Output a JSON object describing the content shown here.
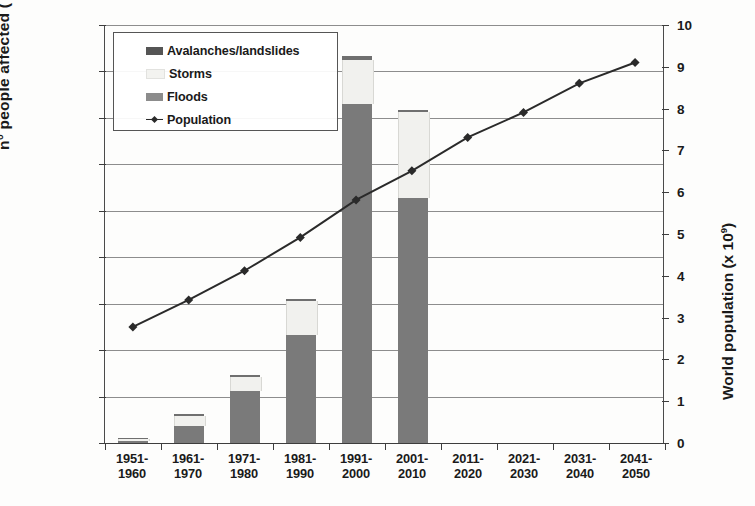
{
  "chart_data": {
    "type": "bar",
    "title": "",
    "subtitle": "",
    "xlabel": "",
    "ylabel": "n° people affected ( x 10⁶)",
    "ylabel_secondary": "World population (x 10⁹)",
    "ylim": [
      0,
      180
    ],
    "ylim_secondary": [
      0,
      10
    ],
    "yticks": [
      0,
      20,
      40,
      60,
      80,
      100,
      120,
      140,
      160,
      180
    ],
    "yticks_secondary": [
      0,
      1,
      2,
      3,
      4,
      5,
      6,
      7,
      8,
      9,
      10
    ],
    "grid": true,
    "legend_position": "upper-left",
    "stacked": true,
    "categories": [
      "1951-\n1960",
      "1961-\n1970",
      "1971-\n1980",
      "1981-\n1990",
      "1991-\n2000",
      "2001-\n2010",
      "2011-\n2020",
      "2021-\n2030",
      "2031-\n2040",
      "2041-\n2050"
    ],
    "category_labels": [
      {
        "top": "1951-",
        "bottom": "1960"
      },
      {
        "top": "1961-",
        "bottom": "1970"
      },
      {
        "top": "1971-",
        "bottom": "1980"
      },
      {
        "top": "1981-",
        "bottom": "1990"
      },
      {
        "top": "1991-",
        "bottom": "2000"
      },
      {
        "top": "2001-",
        "bottom": "2010"
      },
      {
        "top": "2011-",
        "bottom": "2020"
      },
      {
        "top": "2021-",
        "bottom": "2030"
      },
      {
        "top": "2031-",
        "bottom": "2040"
      },
      {
        "top": "2041-",
        "bottom": "2050"
      }
    ],
    "series": [
      {
        "name": "Floods",
        "axis": "left",
        "color": "#7a7a7a",
        "values": [
          1.0,
          7.5,
          22.5,
          46.5,
          146.0,
          105.5,
          null,
          null,
          null,
          null
        ]
      },
      {
        "name": "Storms",
        "axis": "left",
        "color": "#f1f1ee",
        "values": [
          0.8,
          4.0,
          6.0,
          14.5,
          19.0,
          37.0,
          null,
          null,
          null,
          null
        ]
      },
      {
        "name": "Avalanches/landslides",
        "axis": "left",
        "color": "#6f6f6f",
        "values": [
          0.4,
          0.8,
          1.0,
          1.0,
          1.5,
          1.0,
          null,
          null,
          null,
          null
        ]
      },
      {
        "name": "Population",
        "axis": "right",
        "type": "line",
        "color": "#2a2a2a",
        "values": [
          2.75,
          3.4,
          4.1,
          4.9,
          5.8,
          6.5,
          7.3,
          7.9,
          8.6,
          9.1
        ]
      }
    ],
    "stack_totals": [
      2.2,
      12.3,
      29.5,
      62.0,
      166.5,
      143.5,
      null,
      null,
      null,
      null
    ]
  },
  "legend": {
    "items": [
      {
        "label": "Avalanches/landslides",
        "swatch": "avalanches-swatch"
      },
      {
        "label": "Storms",
        "swatch": "storms-swatch"
      },
      {
        "label": "Floods",
        "swatch": "floods-swatch"
      },
      {
        "label": "Population",
        "swatch": "population-line-swatch"
      }
    ]
  },
  "axes": {
    "left_title_main": "n° people affected ( x 10",
    "left_title_sup": "6",
    "left_title_end": ")",
    "right_title_main": "World population (x 10",
    "right_title_sup": "9",
    "right_title_end": ")"
  },
  "colors": {
    "floods": "#7a7a7a",
    "storms": "#f1f1ee",
    "avalanches": "#6f6f6f",
    "population_line": "#2a2a2a",
    "gridline": "#8d8d8d",
    "axis": "#3d3d3d",
    "background": "#fdfdfc"
  }
}
